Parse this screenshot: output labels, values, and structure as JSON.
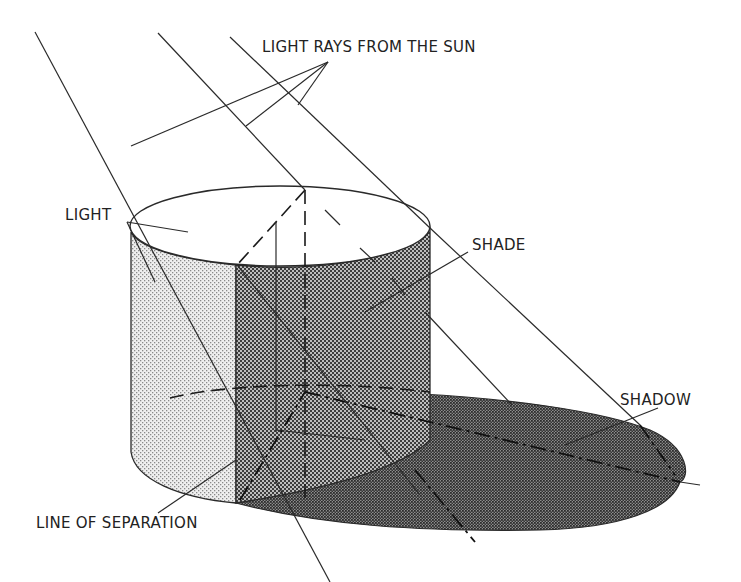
{
  "diagram": {
    "type": "technical illustration",
    "labels": {
      "rays": "LIGHT RAYS FROM THE SUN",
      "light": "LIGHT",
      "shade": "SHADE",
      "shadow": "SHADOW",
      "separation": "LINE OF SEPARATION"
    },
    "colors": {
      "ink": "#2a2a2a",
      "light_tone": "#d9d9d9",
      "shade_tone": "#6e6e6e",
      "shadow_tone": "#4a4a4a",
      "background": "#ffffff"
    }
  }
}
